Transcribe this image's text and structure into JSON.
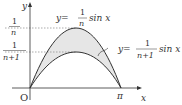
{
  "diagram": {
    "axes": {
      "x_label": "x",
      "y_label": "y",
      "origin_label": "O",
      "pi_label": "π"
    },
    "y_ticks": [
      {
        "num": "1",
        "den": "n"
      },
      {
        "num": "1",
        "den": "n+1"
      }
    ],
    "curves": [
      {
        "name": "upper",
        "eq_prefix": "y=",
        "coef_num": "1",
        "coef_den": "n",
        "func": "sin x"
      },
      {
        "name": "lower",
        "eq_prefix": "y=",
        "coef_num": "1",
        "coef_den": "n+1",
        "func": "sin x"
      }
    ],
    "colors": {
      "curve": "#333333",
      "fill": "#e6e6e6",
      "dash": "#888888"
    }
  }
}
